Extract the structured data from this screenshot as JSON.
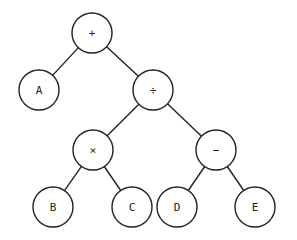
{
  "diagram": {
    "type": "expression-tree",
    "radius": 20,
    "nodes": [
      {
        "id": "plus",
        "label": "+",
        "x": 92,
        "y": 33
      },
      {
        "id": "A",
        "label": "A",
        "x": 39,
        "y": 90
      },
      {
        "id": "div",
        "label": "÷",
        "x": 153,
        "y": 90
      },
      {
        "id": "times",
        "label": "×",
        "x": 93,
        "y": 150
      },
      {
        "id": "minus",
        "label": "−",
        "x": 216,
        "y": 150
      },
      {
        "id": "B",
        "label": "B",
        "x": 53,
        "y": 207
      },
      {
        "id": "C",
        "label": "C",
        "x": 132,
        "y": 207
      },
      {
        "id": "D",
        "label": "D",
        "x": 177,
        "y": 207
      },
      {
        "id": "E",
        "label": "E",
        "x": 255,
        "y": 207
      }
    ],
    "edges": [
      [
        "plus",
        "A"
      ],
      [
        "plus",
        "div"
      ],
      [
        "div",
        "times"
      ],
      [
        "div",
        "minus"
      ],
      [
        "times",
        "B"
      ],
      [
        "times",
        "C"
      ],
      [
        "minus",
        "D"
      ],
      [
        "minus",
        "E"
      ]
    ]
  }
}
